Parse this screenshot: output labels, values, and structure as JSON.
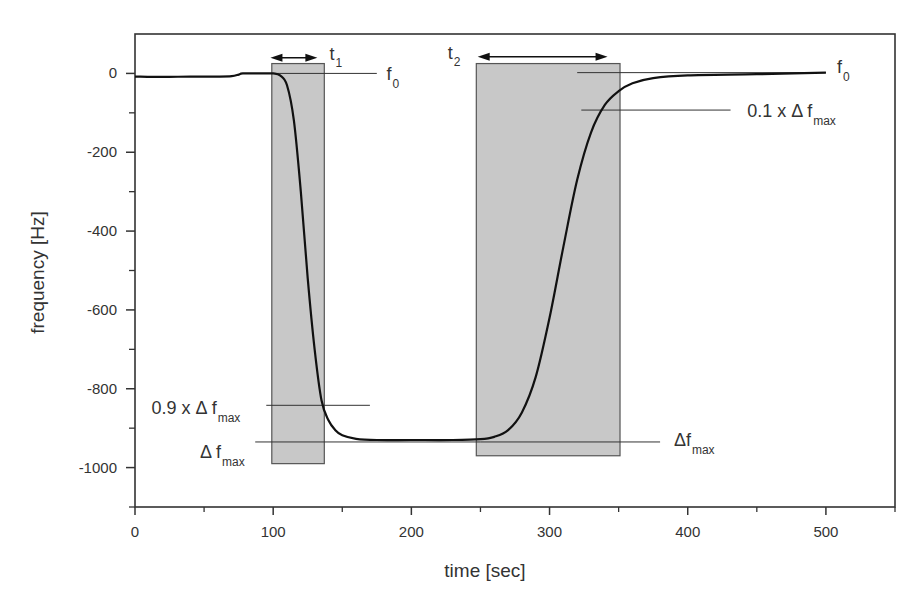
{
  "chart_data": {
    "type": "line",
    "title": "",
    "xlabel": "time [sec]",
    "ylabel": "frequency [Hz]",
    "xlim": [
      0,
      550
    ],
    "ylim": [
      -1100,
      100
    ],
    "x_ticks": [
      0,
      100,
      200,
      300,
      400,
      500
    ],
    "x_minor_ticks": [
      50,
      150,
      250,
      350,
      450,
      550
    ],
    "y_ticks": [
      0,
      -200,
      -400,
      -600,
      -800,
      -1000
    ],
    "y_minor_ticks": [
      -100,
      -300,
      -500,
      -700,
      -900,
      -1100
    ],
    "grid": false,
    "legend": null,
    "series": [
      {
        "name": "frequency",
        "color": "#111111",
        "points": [
          [
            0,
            -8
          ],
          [
            20,
            -9
          ],
          [
            40,
            -8
          ],
          [
            60,
            -8
          ],
          [
            70,
            -7
          ],
          [
            75,
            -3
          ],
          [
            78,
            0
          ],
          [
            90,
            0
          ],
          [
            100,
            0
          ],
          [
            105,
            -5
          ],
          [
            110,
            -30
          ],
          [
            115,
            -120
          ],
          [
            120,
            -300
          ],
          [
            125,
            -520
          ],
          [
            130,
            -700
          ],
          [
            135,
            -830
          ],
          [
            140,
            -880
          ],
          [
            145,
            -905
          ],
          [
            150,
            -918
          ],
          [
            160,
            -927
          ],
          [
            175,
            -930
          ],
          [
            200,
            -930
          ],
          [
            230,
            -930
          ],
          [
            250,
            -928
          ],
          [
            260,
            -922
          ],
          [
            270,
            -905
          ],
          [
            280,
            -860
          ],
          [
            290,
            -770
          ],
          [
            300,
            -620
          ],
          [
            310,
            -440
          ],
          [
            320,
            -270
          ],
          [
            330,
            -150
          ],
          [
            340,
            -80
          ],
          [
            350,
            -45
          ],
          [
            360,
            -25
          ],
          [
            375,
            -12
          ],
          [
            400,
            -5
          ],
          [
            450,
            -2
          ],
          [
            500,
            2
          ]
        ]
      }
    ],
    "shaded_regions": [
      {
        "name": "t1",
        "x_start": 99,
        "x_end": 137,
        "y_top": 25,
        "y_bottom": -990,
        "color": "#c8c8c8"
      },
      {
        "name": "t2",
        "x_start": 247,
        "x_end": 351,
        "y_top": 25,
        "y_bottom": -970,
        "color": "#c8c8c8"
      }
    ],
    "reference_lines": [
      {
        "name": "f0-left",
        "x_start": 100,
        "x_end": 175,
        "y": 0
      },
      {
        "name": "0.9-dfmax",
        "x_start": 95,
        "x_end": 170,
        "y": -842
      },
      {
        "name": "dfmax-left",
        "x_start": 87,
        "x_end": 250,
        "y": -935
      },
      {
        "name": "dfmax-right",
        "x_start": 250,
        "x_end": 380,
        "y": -935
      },
      {
        "name": "f0-right",
        "x_start": 320,
        "x_end": 500,
        "y": 2
      },
      {
        "name": "0.1-dfmax",
        "x_start": 323,
        "x_end": 431,
        "y": -93
      }
    ],
    "arrows": [
      {
        "name": "t1-arrow",
        "x_start": 98,
        "x_end": 132,
        "y": 40,
        "label": "t",
        "subscript": "1"
      },
      {
        "name": "t2-arrow",
        "x_start": 248,
        "x_end": 342,
        "y": 42,
        "label": "t",
        "subscript": "2"
      }
    ],
    "annotations": [
      {
        "name": "f0-left-label",
        "text": "f",
        "subscript": "0",
        "x": 182,
        "y": -16
      },
      {
        "name": "f0-right-label",
        "text": "f",
        "subscript": "0",
        "x": 508,
        "y": 0
      },
      {
        "name": "0.1-dfmax-label",
        "text": "0.1 x Δ f",
        "subscript": "max",
        "x": 443,
        "y": -110
      },
      {
        "name": "0.9-dfmax-label",
        "text": "0.9 x Δ f",
        "subscript": "max",
        "x": 12,
        "y": -865
      },
      {
        "name": "dfmax-left-label",
        "text": "Δ f",
        "subscript": "max",
        "x": 47,
        "y": -975
      },
      {
        "name": "dfmax-right-label",
        "text": "Δf",
        "subscript": "max",
        "x": 390,
        "y": -945
      }
    ],
    "colors": {
      "axis": "#333333",
      "curve": "#111111",
      "shade": "#c8c8c8",
      "shade_border": "#555555",
      "ref_line": "#333333"
    }
  }
}
